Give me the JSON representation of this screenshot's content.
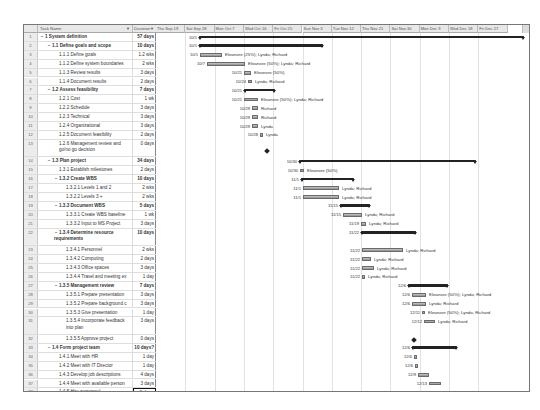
{
  "table": {
    "columns": {
      "id": "",
      "name": "Task Name",
      "duration": "Duration"
    },
    "rows": [
      {
        "id": "1",
        "name": "1 System definition",
        "duration": "57 days",
        "level": 0,
        "summary": true
      },
      {
        "id": "2",
        "name": "1.1 Define goals and scope",
        "duration": "10 days",
        "level": 1,
        "summary": true
      },
      {
        "id": "3",
        "name": "1.1.1 Define goals",
        "duration": "1.2 wks",
        "level": 2
      },
      {
        "id": "4",
        "name": "1.1.2 Define system boundaries",
        "duration": "2 wks",
        "level": 2
      },
      {
        "id": "5",
        "name": "1.1.3 Review results",
        "duration": "3 days",
        "level": 2
      },
      {
        "id": "6",
        "name": "1.1.4 Document results",
        "duration": "2 days",
        "level": 2
      },
      {
        "id": "7",
        "name": "1.2 Assess feasibility",
        "duration": "7 days",
        "level": 1,
        "summary": true
      },
      {
        "id": "8",
        "name": "1.2.1 Cost",
        "duration": "1 wk",
        "level": 2
      },
      {
        "id": "9",
        "name": "1.2.2 Schedule",
        "duration": "3 days",
        "level": 2
      },
      {
        "id": "10",
        "name": "1.2.3 Technical",
        "duration": "3 days",
        "level": 2
      },
      {
        "id": "11",
        "name": "1.2.4 Organizational",
        "duration": "3 days",
        "level": 2
      },
      {
        "id": "12",
        "name": "1.2.5 Document feasibility",
        "duration": "2 days",
        "level": 2
      },
      {
        "id": "13",
        "name": "1.2.6 Management review and go/no go decision",
        "duration": "0 days",
        "level": 2,
        "tall": true
      },
      {
        "id": "14",
        "name": "1.3 Plan project",
        "duration": "34 days",
        "level": 1,
        "summary": true
      },
      {
        "id": "15",
        "name": "1.3.1 Establish milestones",
        "duration": "2 days",
        "level": 2
      },
      {
        "id": "16",
        "name": "1.3.2 Create WBS",
        "duration": "10 days",
        "level": 2,
        "summary": true
      },
      {
        "id": "17",
        "name": "1.3.2.1 Levels 1 and 2",
        "duration": "2 wks",
        "level": 3
      },
      {
        "id": "18",
        "name": "1.3.2.2 Levels 3 +",
        "duration": "2 wks",
        "level": 3
      },
      {
        "id": "19",
        "name": "1.3.3 Document WBS",
        "duration": "5 days",
        "level": 2,
        "summary": true
      },
      {
        "id": "20",
        "name": "1.3.3.1 Create WBS baseline",
        "duration": "1 wk",
        "level": 3
      },
      {
        "id": "21",
        "name": "1.3.3.2 Input to MS Project",
        "duration": "3 days",
        "level": 3
      },
      {
        "id": "22",
        "name": "1.3.4 Determine resource requirements",
        "duration": "10 days",
        "level": 2,
        "summary": true,
        "tall": true
      },
      {
        "id": "23",
        "name": "1.3.4.1 Personnel",
        "duration": "2 wks",
        "level": 3
      },
      {
        "id": "24",
        "name": "1.3.4.2 Computing",
        "duration": "2 days",
        "level": 3
      },
      {
        "id": "25",
        "name": "1.3.4.3 Office spaces",
        "duration": "3 days",
        "level": 3
      },
      {
        "id": "26",
        "name": "1.3.4.4 Travel and meeting ex",
        "duration": "1 day",
        "level": 3
      },
      {
        "id": "27",
        "name": "1.3.5 Management review",
        "duration": "7 days",
        "level": 2,
        "summary": true
      },
      {
        "id": "28",
        "name": "1.3.5.1 Prepare presentation",
        "duration": "3 days",
        "level": 3
      },
      {
        "id": "29",
        "name": "1.3.5.2 Prepare background c",
        "duration": "3 days",
        "level": 3
      },
      {
        "id": "30",
        "name": "1.3.5.3 Give presentation",
        "duration": "1 day",
        "level": 3
      },
      {
        "id": "31",
        "name": "1.3.5.4 Incorporate feedback into plan",
        "duration": "3 days",
        "level": 3,
        "tall": true
      },
      {
        "id": "32",
        "name": "1.3.5.5 Approve project",
        "duration": "0 days",
        "level": 3
      },
      {
        "id": "33",
        "name": "1.4 Form project team",
        "duration": "10 days?",
        "level": 1,
        "summary": true
      },
      {
        "id": "34",
        "name": "1.4.1 Meet with HR",
        "duration": "1 day",
        "level": 2
      },
      {
        "id": "35",
        "name": "1.4.2 Meet with IT Director",
        "duration": "1 day",
        "level": 2
      },
      {
        "id": "36",
        "name": "1.4.3 Develop job descriptions",
        "duration": "4 days",
        "level": 2
      },
      {
        "id": "37",
        "name": "1.4.4 Meet with available person",
        "duration": "3 days",
        "level": 2
      },
      {
        "id": "38",
        "name": "1.4.5 Hire personnel",
        "duration": "2 days",
        "level": 2,
        "selected": true
      },
      {
        "id": "39",
        "name": "",
        "duration": "",
        "level": 0
      }
    ]
  },
  "timescale": [
    "Thu Sep 19",
    "Sat Sep 28",
    "Mon Oct 7",
    "Wed Oct 16",
    "Fri Oct 25",
    "Sun Nov 3",
    "Tue Nov 12",
    "Thu Nov 21",
    "Sat Nov 30",
    "Mon Dec 9",
    "Wed Dec 18",
    "Fri Dec 27"
  ],
  "gantt": {
    "r1": {
      "date": "10/1"
    },
    "r2": {
      "date": "10/1"
    },
    "r3": {
      "date": "10/1",
      "res": "Eleanore (25%); Lynda; Richard"
    },
    "r4": {
      "date": "10/7",
      "res": "Eleanore (50%); Lynda; Richard"
    },
    "r5": {
      "date": "10/21",
      "res": "Eleanore (50%)"
    },
    "r6": {
      "date": "10/24",
      "res": "Lynda; Richard"
    },
    "r7": {
      "date": "10/21"
    },
    "r8": {
      "date": "10/21",
      "res": "Eleanore (50%); Lynda; Richard"
    },
    "r9": {
      "date": "10/29",
      "res": "Richard"
    },
    "r10": {
      "date": "10/29",
      "res": "Richard"
    },
    "r11": {
      "date": "10/29",
      "res": "Lynda"
    },
    "r12": {
      "date": "10/28",
      "res": "Lynda"
    },
    "r14": {
      "date": "10/30"
    },
    "r15": {
      "date": "10/30",
      "res": "Eleanore (50%)"
    },
    "r16": {
      "date": "11/1"
    },
    "r17": {
      "date": "11/1",
      "res": "Lynda; Richard"
    },
    "r18": {
      "date": "11/1",
      "res": "Lynda; Richard"
    },
    "r19": {
      "date": "11/15"
    },
    "r20": {
      "date": "11/15",
      "res": "Lynda; Richard"
    },
    "r21": {
      "date": "11/19",
      "res": "Lynda; Richard"
    },
    "r22": {
      "date": "11/22"
    },
    "r23": {
      "date": "11/22",
      "res": "Lynda; Richard"
    },
    "r24": {
      "date": "11/22",
      "res": "Lynda; Richard"
    },
    "r25": {
      "date": "11/22",
      "res": "Lynda; Richard"
    },
    "r26": {
      "date": "11/22",
      "res": "Lynda; Richard"
    },
    "r27": {
      "date": "12/6"
    },
    "r28": {
      "date": "12/6",
      "res": "Eleanore (50%); Lynda; Richard"
    },
    "r29": {
      "date": "12/6",
      "res": "Lynda; Richard"
    },
    "r30": {
      "date": "12/11",
      "res": "Eleanore (50%); Lynda; Richard"
    },
    "r31": {
      "date": "12/12",
      "res": "Lynda; Richard"
    },
    "r33": {
      "date": "12/6"
    },
    "r34": {
      "date": "12/6"
    },
    "r35": {
      "date": "12/6"
    },
    "r36": {
      "date": "12/9"
    },
    "r37": {
      "date": "12/13"
    },
    "r38": {
      "date": "12/18"
    }
  },
  "colors": {
    "summary_bar": "#222222",
    "task_bar": "#a8a8a8",
    "grid": "#e2e2e2",
    "header_bg": "#e8e8e8"
  }
}
